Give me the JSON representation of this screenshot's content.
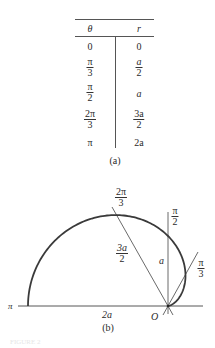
{
  "table": {
    "headers": {
      "theta": "θ",
      "r": "r"
    },
    "rows": [
      {
        "theta": {
          "type": "plain",
          "text": "0"
        },
        "r": {
          "type": "plain",
          "text": "0"
        }
      },
      {
        "theta": {
          "type": "frac",
          "num": "π",
          "den": "3"
        },
        "r": {
          "type": "frac",
          "num": "a",
          "den": "2"
        }
      },
      {
        "theta": {
          "type": "frac",
          "num": "π",
          "den": "2"
        },
        "r": {
          "type": "plain",
          "text": "a"
        }
      },
      {
        "theta": {
          "type": "frac",
          "num": "2π",
          "den": "3"
        },
        "r": {
          "type": "frac",
          "num": "3a",
          "den": "2"
        }
      },
      {
        "theta": {
          "type": "plain",
          "text": "π"
        },
        "r": {
          "type": "plain",
          "text": "2a"
        }
      }
    ],
    "caption": "(a)"
  },
  "diagram": {
    "caption": "(b)",
    "curve": "r = a(1 - cos θ)",
    "origin_label": "O",
    "axis_label_pi": "π",
    "axis_length_label": "2a",
    "ray_2pi3": {
      "angle_label_num": "2π",
      "angle_label_den": "3",
      "length_num": "3a",
      "length_den": "2"
    },
    "ray_pi2": {
      "angle_label_num": "π",
      "angle_label_den": "2",
      "length_label": "a"
    },
    "ray_pi3": {
      "angle_label_num": "π",
      "angle_label_den": "3"
    },
    "stroke_color": "#3a3a3a"
  },
  "footer": {
    "text": "FIGURE 2"
  }
}
